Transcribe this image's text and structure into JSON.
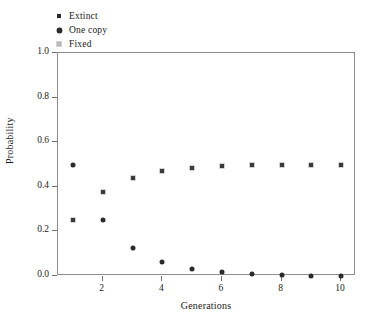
{
  "chart_data": {
    "type": "scatter",
    "title": "",
    "xlabel": "Generations",
    "ylabel": "Probability",
    "xlim": [
      0.5,
      10.5
    ],
    "ylim": [
      0.0,
      1.0
    ],
    "xticks": [
      2,
      4,
      6,
      8,
      10
    ],
    "xtick_labels": [
      "2",
      "4",
      "6",
      "8",
      "10"
    ],
    "yticks": [
      0.0,
      0.2,
      0.4,
      0.6,
      0.8,
      1.0
    ],
    "ytick_labels": [
      "0.0",
      "0.2",
      "0.4",
      "0.6",
      "0.8",
      "1.0"
    ],
    "grid": false,
    "legend_position": "above-left",
    "x": [
      1,
      2,
      3,
      4,
      5,
      6,
      7,
      8,
      9,
      10
    ],
    "series": [
      {
        "name": "Extinct",
        "marker": "square",
        "color": "#3a3a3a",
        "values": [
          0.25,
          0.375,
          0.441,
          0.472,
          0.486,
          0.493,
          0.496,
          0.498,
          0.499,
          0.4995
        ]
      },
      {
        "name": "One copy",
        "marker": "diamond",
        "color": "#2b2b2b",
        "values": [
          0.5,
          0.25,
          0.125,
          0.0625,
          0.031,
          0.016,
          0.008,
          0.004,
          0.002,
          0.001
        ]
      },
      {
        "name": "Fixed",
        "marker": "square-light",
        "color": "#a8a8a8",
        "values": [
          0.25,
          0.375,
          0.441,
          0.472,
          0.486,
          0.493,
          0.496,
          0.498,
          0.499,
          0.4995
        ]
      }
    ]
  },
  "legend": {
    "items": [
      {
        "label": "Extinct",
        "marker": "square-filled-icon"
      },
      {
        "label": "One copy",
        "marker": "diamond-filled-icon"
      },
      {
        "label": "Fixed",
        "marker": "square-light-icon"
      }
    ]
  },
  "axes": {
    "x_title": "Generations",
    "y_title": "Probability"
  }
}
